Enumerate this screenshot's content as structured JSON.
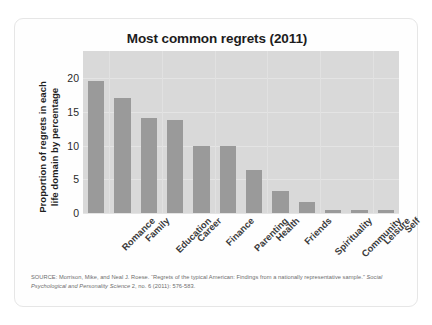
{
  "card": {
    "title": "Most common regrets (2011)"
  },
  "axes": {
    "y_title_line1": "Proportion of regrets in each",
    "y_title_line2": "life domain by percentage",
    "y_ticks": [
      "20",
      "15",
      "10",
      "5",
      "0"
    ]
  },
  "source": {
    "text_part1": "SOURCE: Morrison, Mike, and Neal J. Roese. “Regrets of the typical American: Findings from a nationally representative sample.” ",
    "journal": "Social Psychological and Personality Science",
    "text_part2": " 2, no. 6 (2011): 576-583."
  },
  "colors": {
    "bar": "#9a9a9a",
    "plot_background": "#d9d9d9",
    "card_background": "#fefefe",
    "card_border": "#e6e6e6",
    "gridline": "#e4e4e4",
    "title_text": "#1c1c1c",
    "source_text": "#6d6d6d"
  },
  "chart_data": {
    "type": "bar",
    "title": "Most common regrets (2011)",
    "xlabel": "",
    "ylabel": "Proportion of regrets in each life domain by percentage",
    "ylim": [
      0,
      24
    ],
    "yticks": [
      0,
      5,
      10,
      15,
      20
    ],
    "grid": true,
    "legend": "none",
    "categories": [
      "Romance",
      "Family",
      "Education",
      "Career",
      "Finance",
      "Parenting",
      "Health",
      "Friends",
      "Spirituality",
      "Community",
      "Leisure",
      "Self"
    ],
    "values": [
      19.6,
      17.1,
      14.1,
      13.8,
      9.9,
      9.9,
      6.3,
      3.3,
      1.7,
      0.5,
      0.5,
      0.5
    ]
  }
}
